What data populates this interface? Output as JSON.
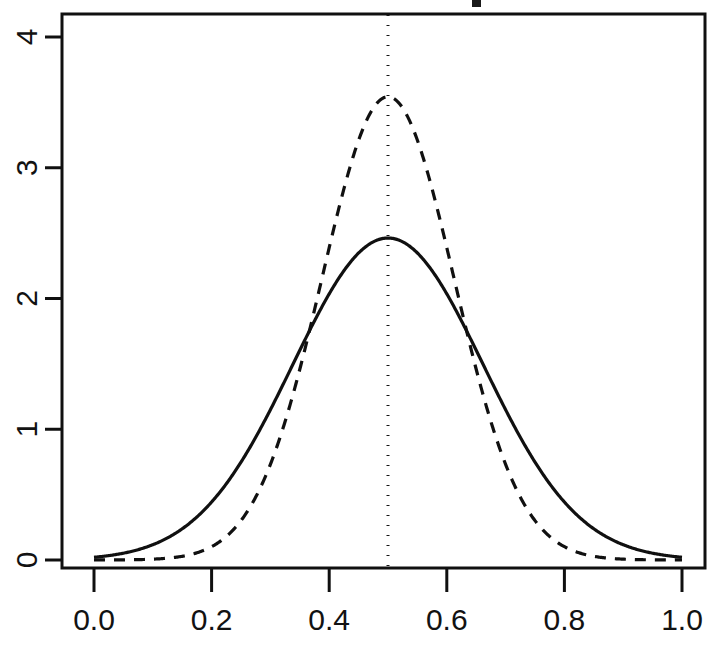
{
  "chart_data": {
    "type": "line",
    "title": "",
    "subtitle": "",
    "xlabel": "",
    "ylabel": "",
    "xlim": [
      0.0,
      1.0
    ],
    "ylim": [
      0.0,
      4.2
    ],
    "grid": false,
    "legend": null,
    "x_ticks": [
      "0.0",
      "0.2",
      "0.4",
      "0.6",
      "0.8",
      "1.0"
    ],
    "x_tick_values": [
      0.0,
      0.2,
      0.4,
      0.6,
      0.8,
      1.0
    ],
    "y_ticks": [
      "0",
      "1",
      "2",
      "3",
      "4"
    ],
    "y_tick_values": [
      0,
      1,
      2,
      3,
      4
    ],
    "y_tick_rotation_deg": 90,
    "box_border": true,
    "annotations": [
      {
        "name": "vertical-reference-line",
        "type": "vline",
        "x": 0.5,
        "style": "dotted",
        "color": "#151515"
      }
    ],
    "series": [
      {
        "name": "solid-density-curve",
        "style": "solid",
        "color": "#101010",
        "linewidth": 3.2,
        "peak_x": 0.5,
        "peak_y": 2.46,
        "mean": 0.5,
        "sd": 0.162,
        "x": [
          0.0,
          0.02,
          0.04,
          0.06,
          0.08,
          0.1,
          0.12,
          0.14,
          0.16,
          0.18,
          0.2,
          0.22,
          0.24,
          0.26,
          0.28,
          0.3,
          0.32,
          0.34,
          0.36,
          0.38,
          0.4,
          0.42,
          0.44,
          0.46,
          0.48,
          0.5,
          0.52,
          0.54,
          0.56,
          0.58,
          0.6,
          0.62,
          0.64,
          0.66,
          0.68,
          0.7,
          0.72,
          0.74,
          0.76,
          0.78,
          0.8,
          0.82,
          0.84,
          0.86,
          0.88,
          0.9,
          0.92,
          0.94,
          0.96,
          0.98,
          1.0
        ],
        "y": [
          0.007,
          0.012,
          0.021,
          0.035,
          0.056,
          0.087,
          0.131,
          0.192,
          0.272,
          0.375,
          0.501,
          0.651,
          0.823,
          1.013,
          1.215,
          1.422,
          1.625,
          1.814,
          1.98,
          2.114,
          2.211,
          2.268,
          2.283,
          2.258,
          2.196,
          2.46,
          2.196,
          2.258,
          2.283,
          2.268,
          2.211,
          2.114,
          1.98,
          1.814,
          1.625,
          1.422,
          1.215,
          1.013,
          0.823,
          0.651,
          0.501,
          0.375,
          0.272,
          0.192,
          0.131,
          0.087,
          0.056,
          0.035,
          0.021,
          0.012,
          0.007
        ]
      },
      {
        "name": "dashed-density-curve",
        "style": "dashed",
        "color": "#101010",
        "linewidth": 3.2,
        "peak_x": 0.5,
        "peak_y": 3.54,
        "mean": 0.5,
        "sd": 0.1126,
        "x": [
          0.0,
          0.02,
          0.04,
          0.06,
          0.08,
          0.1,
          0.12,
          0.14,
          0.16,
          0.18,
          0.2,
          0.22,
          0.24,
          0.26,
          0.28,
          0.3,
          0.32,
          0.34,
          0.36,
          0.38,
          0.4,
          0.42,
          0.44,
          0.46,
          0.48,
          0.5,
          0.52,
          0.54,
          0.56,
          0.58,
          0.6,
          0.62,
          0.64,
          0.66,
          0.68,
          0.7,
          0.72,
          0.74,
          0.76,
          0.78,
          0.8,
          0.82,
          0.84,
          0.86,
          0.88,
          0.9,
          0.92,
          0.94,
          0.96,
          0.98,
          1.0
        ],
        "y": [
          0.0,
          0.0,
          0.001,
          0.002,
          0.005,
          0.012,
          0.026,
          0.053,
          0.101,
          0.182,
          0.31,
          0.5,
          0.764,
          1.106,
          1.516,
          1.968,
          2.422,
          2.828,
          3.141,
          3.332,
          3.398,
          3.354,
          3.226,
          3.045,
          2.838,
          3.54,
          2.838,
          3.045,
          3.226,
          3.354,
          3.398,
          3.332,
          3.141,
          2.828,
          2.422,
          1.968,
          1.516,
          1.106,
          0.764,
          0.5,
          0.31,
          0.182,
          0.101,
          0.053,
          0.026,
          0.012,
          0.005,
          0.002,
          0.001,
          0.0,
          0.0
        ]
      }
    ],
    "crossings": [
      {
        "x": 0.362,
        "y": 1.81
      },
      {
        "x": 0.636,
        "y": 1.72
      }
    ]
  }
}
